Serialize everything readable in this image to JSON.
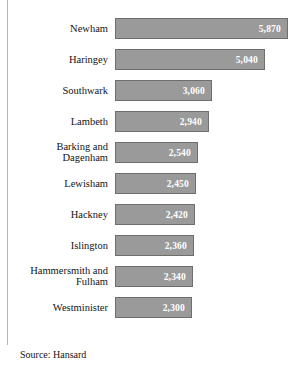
{
  "figure": {
    "source_note": "Source: Hansard",
    "accent_color": "#9a9a9a",
    "border_color": "#6e6e6e",
    "value_text_color": "#ffffff",
    "rule_color": "#b4b4b4"
  },
  "chart_data": {
    "type": "bar",
    "orientation": "horizontal",
    "title": "",
    "subtitle": "",
    "xlabel": "",
    "ylabel": "",
    "grid": false,
    "legend": null,
    "axis_visible": false,
    "sorted": "descending",
    "categories": [
      "Newham",
      "Haringey",
      "Southwark",
      "Lambeth",
      "Barking and Dagenham",
      "Lewisham",
      "Hackney",
      "Islington",
      "Hammersmith and Fulham",
      "Westminister"
    ],
    "values": [
      5870,
      5040,
      3060,
      2940,
      2540,
      2450,
      2420,
      2360,
      2340,
      2300
    ],
    "value_labels": [
      "5,870",
      "5,040",
      "3,060",
      "2,940",
      "2,540",
      "2,450",
      "2,420",
      "2,360",
      "2,340",
      "2,300"
    ],
    "bars": [
      {
        "category": "Newham",
        "label_lines": "Newham",
        "value": 5870,
        "value_label": "5,870",
        "bar_px": 173
      },
      {
        "category": "Haringey",
        "label_lines": "Haringey",
        "value": 5040,
        "value_label": "5,040",
        "bar_px": 150
      },
      {
        "category": "Southwark",
        "label_lines": "Southwark",
        "value": 3060,
        "value_label": "3,060",
        "bar_px": 97
      },
      {
        "category": "Lambeth",
        "label_lines": "Lambeth",
        "value": 2940,
        "value_label": "2,940",
        "bar_px": 94
      },
      {
        "category": "Barking and Dagenham",
        "label_lines": "Barking and\nDagenham",
        "value": 2540,
        "value_label": "2,540",
        "bar_px": 83
      },
      {
        "category": "Lewisham",
        "label_lines": "Lewisham",
        "value": 2450,
        "value_label": "2,450",
        "bar_px": 81
      },
      {
        "category": "Hackney",
        "label_lines": "Hackney",
        "value": 2420,
        "value_label": "2,420",
        "bar_px": 80
      },
      {
        "category": "Islington",
        "label_lines": "Islington",
        "value": 2360,
        "value_label": "2,360",
        "bar_px": 79
      },
      {
        "category": "Hammersmith and Fulham",
        "label_lines": "Hammersmith and\nFulham",
        "value": 2340,
        "value_label": "2,340",
        "bar_px": 78
      },
      {
        "category": "Westminister",
        "label_lines": "Westminister",
        "value": 2300,
        "value_label": "2,300",
        "bar_px": 77
      }
    ]
  }
}
